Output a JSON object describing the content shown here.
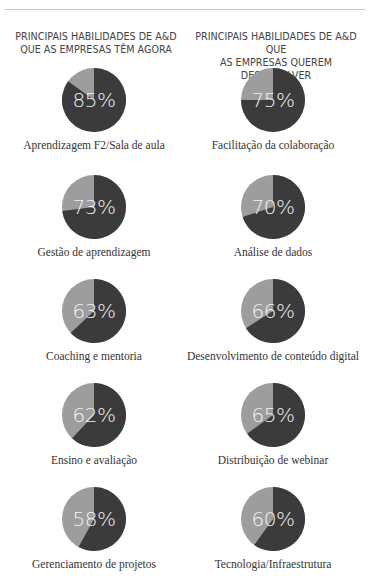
{
  "header": {
    "left_title": "PRINCIPAIS HABILIDADES DE A&D QUE AS EMPRESAS TÊM AGORA",
    "left_title_line1": "PRINCIPAIS HABILIDADES DE A&D",
    "left_title_line2": "QUE AS EMPRESAS TÊM AGORA",
    "right_title": "PRINCIPAIS HABILIDADES DE A&D QUE AS EMPRESAS QUEREM DESENVOLVER",
    "right_title_line1": "PRINCIPAIS HABILIDADES DE A&D QUE",
    "right_title_line2": "AS EMPRESAS QUEREM DESENVOLVER"
  },
  "colors": {
    "dark_slice": "#3b3b3b",
    "light_slice": "#9d9d9d",
    "percent_text": "#f2f2f2",
    "rule": "#c8c8c8"
  },
  "chart_data": [
    {
      "type": "pie",
      "title": "PRINCIPAIS HABILIDADES DE A&D QUE AS EMPRESAS TÊM AGORA",
      "categories": [
        "Aprendizagem F2/Sala de aula",
        "Gestão de aprendizagem",
        "Coaching e mentoria",
        "Ensino e avaliação",
        "Gerenciamento de projetos"
      ],
      "values": [
        85,
        73,
        63,
        62,
        58
      ],
      "labels": [
        "85%",
        "73%",
        "63%",
        "62%",
        "58%"
      ],
      "unit": "%"
    },
    {
      "type": "pie",
      "title": "PRINCIPAIS HABILIDADES DE A&D QUE AS EMPRESAS QUEREM DESENVOLVER",
      "categories": [
        "Facilitação da colaboração",
        "Análise de dados",
        "Desenvolvimento de conteúdo digital",
        "Distribuição de webinar",
        "Tecnologia/Infraestrutura"
      ],
      "values": [
        75,
        70,
        66,
        65,
        60
      ],
      "labels": [
        "75%",
        "70%",
        "66%",
        "65%",
        "60%"
      ],
      "unit": "%"
    }
  ],
  "left": [
    {
      "pct": "85%",
      "value": 85,
      "label": "Aprendizagem F2/Sala de aula"
    },
    {
      "pct": "73%",
      "value": 73,
      "label": "Gestão de aprendizagem"
    },
    {
      "pct": "63%",
      "value": 63,
      "label": "Coaching e mentoria"
    },
    {
      "pct": "62%",
      "value": 62,
      "label": "Ensino e avaliação"
    },
    {
      "pct": "58%",
      "value": 58,
      "label": "Gerenciamento de projetos"
    }
  ],
  "right": [
    {
      "pct": "75%",
      "value": 75,
      "label": "Facilitação da colaboração"
    },
    {
      "pct": "70%",
      "value": 70,
      "label": "Análise de dados"
    },
    {
      "pct": "66%",
      "value": 66,
      "label": "Desenvolvimento de conteúdo digital"
    },
    {
      "pct": "65%",
      "value": 65,
      "label": "Distribuição de webinar"
    },
    {
      "pct": "60%",
      "value": 60,
      "label": "Tecnologia/Infraestrutura"
    }
  ]
}
